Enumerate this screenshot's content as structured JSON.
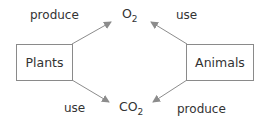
{
  "diagram": {
    "nodes": {
      "plants": {
        "label": "Plants"
      },
      "animals": {
        "label": "Animals"
      },
      "o2": {
        "base": "O",
        "subscript": "2"
      },
      "co2": {
        "base": "CO",
        "subscript": "2"
      }
    },
    "edges": [
      {
        "from": "Plants",
        "to": "O2",
        "label": "produce"
      },
      {
        "from": "O2",
        "to": "Animals",
        "label": "use",
        "arrow_points_to": "O2"
      },
      {
        "from": "CO2",
        "to": "Plants",
        "label": "use",
        "arrow_points_to": "CO2"
      },
      {
        "from": "Animals",
        "to": "CO2",
        "label": "produce"
      }
    ],
    "labels": {
      "top_left": "produce",
      "top_right": "use",
      "bottom_left": "use",
      "bottom_right": "produce"
    },
    "colors": {
      "arrow": "#8c8c8c",
      "box_border": "#8a8a8a",
      "text": "#333333"
    }
  }
}
